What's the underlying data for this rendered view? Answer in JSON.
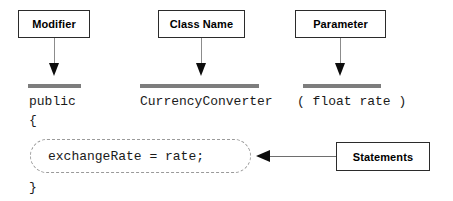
{
  "diagram": {
    "colors": {
      "box_border": "#2b2b2b",
      "connector": "#8c8c8c",
      "arrow": "#0d0d0d",
      "highlight_bar": "#7d7d7d",
      "dashed_border": "#9a9a9a",
      "code_text": "#1a1a1a",
      "background": "#ffffff"
    },
    "callouts": [
      {
        "id": "modifier",
        "label": "Modifier",
        "points_to": "public"
      },
      {
        "id": "class-name",
        "label": "Class Name",
        "points_to": "CurrencyConverter"
      },
      {
        "id": "parameter",
        "label": "Parameter",
        "points_to": "( float rate )"
      },
      {
        "id": "statements",
        "label": "Statements",
        "points_to": "exchangeRate = rate;"
      }
    ],
    "code": {
      "signature": {
        "modifier": "public",
        "class_name": "CurrencyConverter",
        "parameter": "( float rate )"
      },
      "open_brace": "{",
      "statement": "exchangeRate = rate;",
      "close_brace": "}"
    }
  }
}
